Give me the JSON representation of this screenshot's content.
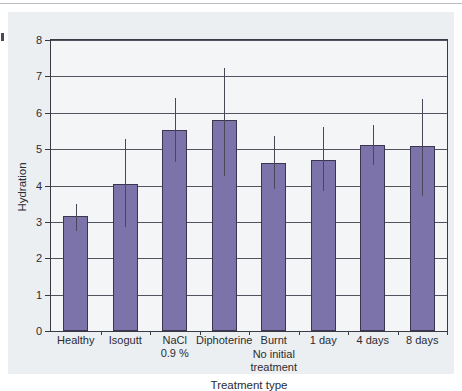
{
  "figure": {
    "background": "#eceff1",
    "plot_background": "#f4f5f6",
    "bar_color": "#7b73a9",
    "bar_edge_color": "#3b3550",
    "error_bar_color": "#4a4758",
    "axis_color": "#3a3a44",
    "grid_color": "#53535f"
  },
  "chart_data": {
    "type": "bar",
    "title": "",
    "xlabel": "Treatment type",
    "ylabel": "Hydration",
    "categories": [
      "Healthy",
      "Isogutt",
      "NaCl 0.9 %",
      "Diphoterine",
      "Burnt",
      "1 day",
      "4 days",
      "8 days"
    ],
    "category_lines": [
      [
        "Healthy"
      ],
      [
        "Isogutt"
      ],
      [
        "NaCl",
        "0.9 %"
      ],
      [
        "Diphoterine"
      ],
      [
        "Burnt"
      ],
      [
        "1 day"
      ],
      [
        "4 days"
      ],
      [
        "8 days"
      ]
    ],
    "values": [
      3.17,
      4.05,
      5.52,
      5.79,
      4.61,
      4.7,
      5.12,
      5.08
    ],
    "error_low": [
      2.76,
      2.85,
      4.64,
      4.26,
      3.91,
      3.84,
      4.57,
      3.72
    ],
    "error_high": [
      3.5,
      5.27,
      6.4,
      7.22,
      5.35,
      5.61,
      5.67,
      6.39
    ],
    "ylim": [
      0,
      8
    ],
    "yticks": [
      0,
      1,
      2,
      3,
      4,
      5,
      6,
      7,
      8
    ],
    "ytick_labels": [
      "0",
      "1",
      "2",
      "3",
      "4",
      "5",
      "6",
      "7",
      "8"
    ],
    "grid": true,
    "grid_axis": "y",
    "legend": null,
    "annotations": [
      {
        "text_lines": [
          "No initial",
          "treatment"
        ],
        "near_category": "Burnt"
      }
    ]
  }
}
